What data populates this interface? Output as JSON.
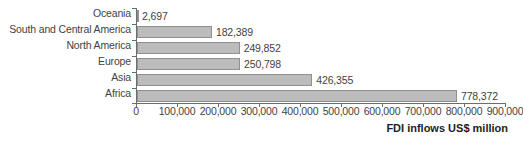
{
  "chart_data": {
    "type": "bar",
    "orientation": "horizontal",
    "title": "",
    "xlabel": "FDI inflows US$ million",
    "ylabel": "",
    "categories": [
      "Oceania",
      "South and Central America",
      "North America",
      "Europe",
      "Asia",
      "Africa"
    ],
    "values": [
      2697,
      182389,
      249852,
      250798,
      426355,
      778372
    ],
    "value_labels": [
      "2,697",
      "182,389",
      "249,852",
      "250,798",
      "426,355",
      "778,372"
    ],
    "xlim": [
      0,
      900000
    ],
    "xticks": [
      0,
      100000,
      200000,
      300000,
      400000,
      500000,
      600000,
      700000,
      800000,
      900000
    ],
    "xtick_labels": [
      "0",
      "100,000",
      "200,000",
      "300,000",
      "400,000",
      "500,000",
      "600,000",
      "700,000",
      "800,000",
      "900,000"
    ],
    "grid": false,
    "legend": false,
    "bar_color": "#bcbcbc",
    "bar_border_color": "#8f8f8f",
    "axis_color": "#6d6d6d",
    "text_color": "#3f3f3f"
  }
}
